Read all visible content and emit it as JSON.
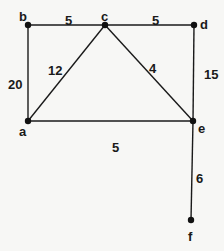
{
  "graph": {
    "nodes": [
      {
        "id": "a",
        "label": "a",
        "x": 28,
        "y": 121,
        "lx": 19,
        "ly": 136
      },
      {
        "id": "b",
        "label": "b",
        "x": 28,
        "y": 25,
        "lx": 19,
        "ly": 21
      },
      {
        "id": "c",
        "label": "c",
        "x": 105,
        "y": 25,
        "lx": 101,
        "ly": 21
      },
      {
        "id": "d",
        "label": "d",
        "x": 194,
        "y": 25,
        "lx": 200,
        "ly": 29
      },
      {
        "id": "e",
        "label": "e",
        "x": 193,
        "y": 121,
        "lx": 198,
        "ly": 133
      },
      {
        "id": "f",
        "label": "f",
        "x": 191,
        "y": 220,
        "lx": 188,
        "ly": 241
      }
    ],
    "edges": [
      {
        "from": "b",
        "to": "c",
        "weight": "5",
        "lx": 65,
        "ly": 20
      },
      {
        "from": "c",
        "to": "d",
        "weight": "5",
        "lx": 152,
        "ly": 20
      },
      {
        "from": "b",
        "to": "a",
        "weight": "20",
        "lx": 8,
        "ly": 84
      },
      {
        "from": "a",
        "to": "c",
        "weight": "12",
        "lx": 48,
        "ly": 70
      },
      {
        "from": "c",
        "to": "e",
        "weight": "4",
        "lx": 149,
        "ly": 68
      },
      {
        "from": "d",
        "to": "e",
        "weight": "15",
        "lx": 204,
        "ly": 74
      },
      {
        "from": "a",
        "to": "e",
        "weight": "5",
        "lx": 112,
        "ly": 147
      },
      {
        "from": "e",
        "to": "f",
        "weight": "6",
        "lx": 196,
        "ly": 178
      }
    ]
  }
}
